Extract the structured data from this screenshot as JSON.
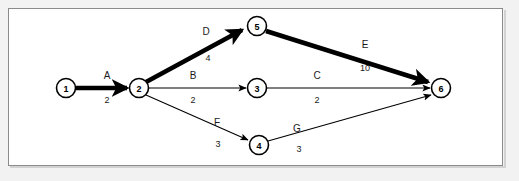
{
  "diagram": {
    "background_color": "#f2f2f2",
    "panel_color": "#ffffff",
    "border_color": "#8a8a8a",
    "line_color": "#000000",
    "nodes": [
      {
        "id": "1",
        "label": "1",
        "x": 66,
        "y": 88,
        "r": 9.5
      },
      {
        "id": "2",
        "label": "2",
        "x": 139,
        "y": 88,
        "r": 9.5
      },
      {
        "id": "3",
        "label": "3",
        "x": 257,
        "y": 88,
        "r": 9.5
      },
      {
        "id": "4",
        "label": "4",
        "x": 259,
        "y": 145,
        "r": 9.5
      },
      {
        "id": "5",
        "label": "5",
        "x": 257,
        "y": 26,
        "r": 9.5
      },
      {
        "id": "6",
        "label": "6",
        "x": 441,
        "y": 88,
        "r": 9.5
      }
    ],
    "edges": [
      {
        "id": "A",
        "name": "A",
        "weight": "2",
        "from": "1",
        "to": "2",
        "critical": true,
        "name_x": 107,
        "name_y": 79,
        "weight_x": 107,
        "weight_y": 103
      },
      {
        "id": "D",
        "name": "D",
        "weight": "4",
        "from": "2",
        "to": "5",
        "critical": true,
        "name_x": 206,
        "name_y": 35,
        "weight_x": 208,
        "weight_y": 61
      },
      {
        "id": "E",
        "name": "E",
        "weight": "10",
        "from": "5",
        "to": "6",
        "critical": true,
        "name_x": 365,
        "name_y": 48,
        "weight_x": 365,
        "weight_y": 71
      },
      {
        "id": "B",
        "name": "B",
        "weight": "2",
        "from": "2",
        "to": "3",
        "critical": false,
        "name_x": 193,
        "name_y": 79,
        "weight_x": 193,
        "weight_y": 103
      },
      {
        "id": "C",
        "name": "C",
        "weight": "2",
        "from": "3",
        "to": "6",
        "critical": false,
        "name_x": 317,
        "name_y": 79,
        "weight_x": 317,
        "weight_y": 103
      },
      {
        "id": "F",
        "name": "F",
        "weight": "3",
        "from": "2",
        "to": "4",
        "critical": false,
        "name_x": 217,
        "name_y": 126,
        "weight_x": 218,
        "weight_y": 147
      },
      {
        "id": "G",
        "name": "G",
        "weight": "3",
        "from": "4",
        "to": "6",
        "critical": false,
        "name_x": 297,
        "name_y": 132,
        "weight_x": 299,
        "weight_y": 152
      }
    ]
  }
}
